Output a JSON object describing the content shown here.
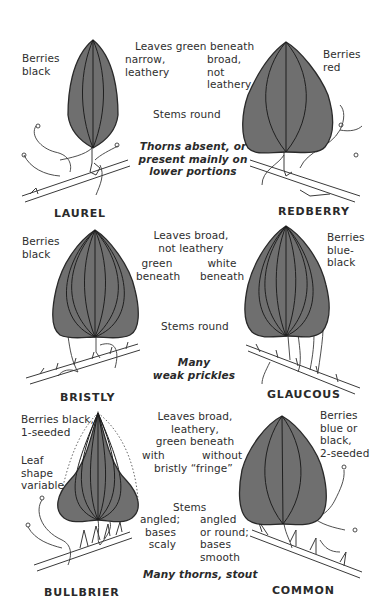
{
  "plate": {
    "section_top": {
      "shared": {
        "leaves_header": "Leaves green beneath",
        "stems": "Stems round",
        "thorns_line1": "Thorns absent, or",
        "thorns_line2": "present mainly on",
        "thorns_line3": "lower portions"
      },
      "left": {
        "name": "LAUREL",
        "berries_line1": "Berries",
        "berries_line2": "black",
        "leaf_line1": "narrow,",
        "leaf_line2": "leathery"
      },
      "right": {
        "name": "REDBERRY",
        "berries_line1": "Berries",
        "berries_line2": "red",
        "leaf_line1": "broad,",
        "leaf_line2": "not",
        "leaf_line3": "leathery"
      }
    },
    "section_middle": {
      "shared": {
        "leaves_line1": "Leaves broad,",
        "leaves_line2": "not leathery",
        "stems": "Stems round",
        "prickles_line1": "Many",
        "prickles_line2": "weak prickles"
      },
      "left": {
        "name": "BRISTLY",
        "berries_line1": "Berries",
        "berries_line2": "black",
        "beneath_line1": "green",
        "beneath_line2": "beneath"
      },
      "right": {
        "name": "GLAUCOUS",
        "berries_line1": "Berries",
        "berries_line2": "blue-",
        "berries_line3": "black",
        "beneath_line1": "white",
        "beneath_line2": "beneath"
      }
    },
    "section_bottom": {
      "shared": {
        "leaves_line1": "Leaves broad,",
        "leaves_line2": "leathery,",
        "leaves_line3": "green beneath",
        "fringe_line": "bristly “fringe”",
        "stems": "Stems",
        "thorns": "Many thorns, stout"
      },
      "left": {
        "name": "BULLBRIER",
        "berries_line1": "Berries black,",
        "berries_line2": "1-seeded",
        "shape_line1": "Leaf",
        "shape_line2": "shape",
        "shape_line3": "variable",
        "fringe_qual": "with",
        "stems_line1": "angled;",
        "stems_line2": "bases",
        "stems_line3": "scaly"
      },
      "right": {
        "name": "COMMON",
        "berries_line1": "Berries",
        "berries_line2": "blue or",
        "berries_line3": "black,",
        "berries_line4": "2-seeded",
        "fringe_qual": "without",
        "stems_line1": "angled",
        "stems_line2": "or round;",
        "stems_line3": "bases",
        "stems_line4": "smooth"
      }
    },
    "colors": {
      "leaf_fill": "#6f6f6f",
      "line": "#2a2a2a",
      "background": "#ffffff"
    }
  }
}
